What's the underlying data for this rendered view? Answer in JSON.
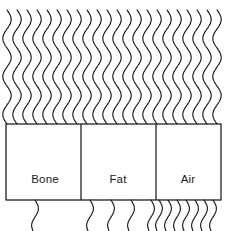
{
  "canvas": {
    "width": 228,
    "height": 231,
    "background": "#ffffff",
    "stroke_color": "#1a1a1a"
  },
  "figure": {
    "type": "schematic-diagram"
  },
  "incident_field": {
    "label": "incident-waves",
    "count": 22,
    "x_start": 7,
    "x_spacing": 10.0,
    "y_top": 10,
    "y_bottom": 124,
    "amplitude": 4.2,
    "wavelength": 38
  },
  "barrier": {
    "x": 6,
    "y": 124,
    "width": 215,
    "height": 76,
    "dividers": [
      81,
      156
    ],
    "regions": [
      {
        "name": "bone",
        "label": "Bone",
        "label_x": 45,
        "label_y": 179,
        "x_start": 6,
        "x_end": 81,
        "transmitted_count": 1
      },
      {
        "name": "fat",
        "label": "Fat",
        "label_x": 118,
        "label_y": 179,
        "x_start": 81,
        "x_end": 156,
        "transmitted_count": 4
      },
      {
        "name": "air",
        "label": "Air",
        "label_x": 188,
        "label_y": 179,
        "x_start": 156,
        "x_end": 221,
        "transmitted_count": 7
      }
    ]
  },
  "transmitted_field": {
    "label": "transmitted-waves",
    "y_top": 200,
    "y_bottom": 231,
    "amplitude": 3.4,
    "wavelength": 34,
    "x_positions_bone": [
      35
    ],
    "x_positions_fat": [
      90,
      111,
      131,
      151
    ],
    "x_positions_air": [
      159,
      168,
      177,
      186,
      195,
      204,
      213
    ]
  }
}
